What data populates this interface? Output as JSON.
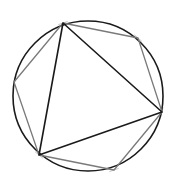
{
  "diagram": {
    "canvas": {
      "width": 173,
      "height": 189,
      "background": "#ffffff"
    },
    "circle": {
      "cx": 88,
      "cy": 96,
      "r": 75,
      "stroke": "#1a1a1a",
      "stroke_width": 1.6
    },
    "hexagon_vertices": [
      {
        "x": 63,
        "y": 23
      },
      {
        "x": 138,
        "y": 38
      },
      {
        "x": 162,
        "y": 112
      },
      {
        "x": 114,
        "y": 170
      },
      {
        "x": 39,
        "y": 155
      },
      {
        "x": 14,
        "y": 82
      }
    ],
    "hexagon_style": {
      "stroke": "#7a7a7a",
      "stroke_width": 1.3
    },
    "triangle_vertex_indices": [
      0,
      2,
      4
    ],
    "triangle_style": {
      "stroke": "#1a1a1a",
      "stroke_width": 1.6
    },
    "tick_marks": {
      "stroke": "#c8c8c8",
      "stroke_width": 1,
      "length": 5
    }
  }
}
